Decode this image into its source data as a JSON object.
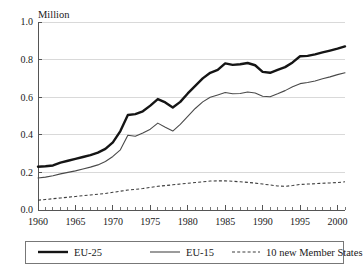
{
  "chart_data": {
    "type": "line",
    "title": "",
    "subtitle": "",
    "xlabel": "",
    "ylabel": "Million",
    "ylabel_position": "top-left",
    "xlim": [
      1960,
      2001
    ],
    "ylim": [
      0.0,
      1.0
    ],
    "grid": true,
    "grid_axis": "y",
    "legend_position": "bottom",
    "y_ticks": [
      "0.0",
      "0.2",
      "0.4",
      "0.6",
      "0.8",
      "1.0"
    ],
    "y_tick_values": [
      0.0,
      0.2,
      0.4,
      0.6,
      0.8,
      1.0
    ],
    "x_ticks": [
      "1960",
      "1965",
      "1970",
      "1975",
      "1980",
      "1985",
      "1990",
      "1995",
      "2000"
    ],
    "x_tick_values": [
      1960,
      1965,
      1970,
      1975,
      1980,
      1985,
      1990,
      1995,
      2000
    ],
    "x_minor_tick_step": 1,
    "x": [
      1960,
      1961,
      1962,
      1963,
      1964,
      1965,
      1966,
      1967,
      1968,
      1969,
      1970,
      1971,
      1972,
      1973,
      1974,
      1975,
      1976,
      1977,
      1978,
      1979,
      1980,
      1981,
      1982,
      1983,
      1984,
      1985,
      1986,
      1987,
      1988,
      1989,
      1990,
      1991,
      1992,
      1993,
      1994,
      1995,
      1996,
      1997,
      1998,
      1999,
      2000,
      2001
    ],
    "series": [
      {
        "name": "EU-25",
        "style": "solid-thick",
        "color": "#151515",
        "values": [
          0.23,
          0.233,
          0.237,
          0.252,
          0.262,
          0.272,
          0.282,
          0.292,
          0.305,
          0.325,
          0.36,
          0.42,
          0.505,
          0.51,
          0.525,
          0.555,
          0.59,
          0.572,
          0.545,
          0.575,
          0.62,
          0.66,
          0.7,
          0.73,
          0.745,
          0.78,
          0.772,
          0.775,
          0.782,
          0.77,
          0.735,
          0.73,
          0.745,
          0.76,
          0.785,
          0.818,
          0.82,
          0.828,
          0.838,
          0.848,
          0.858,
          0.87
        ]
      },
      {
        "name": "EU-15",
        "style": "solid-thin",
        "color": "#4a4a4a",
        "values": [
          0.17,
          0.175,
          0.182,
          0.192,
          0.2,
          0.208,
          0.218,
          0.228,
          0.24,
          0.258,
          0.285,
          0.32,
          0.398,
          0.392,
          0.41,
          0.43,
          0.462,
          0.44,
          0.42,
          0.455,
          0.498,
          0.54,
          0.575,
          0.6,
          0.612,
          0.625,
          0.618,
          0.62,
          0.628,
          0.622,
          0.605,
          0.602,
          0.618,
          0.635,
          0.655,
          0.672,
          0.678,
          0.686,
          0.698,
          0.708,
          0.72,
          0.73
        ]
      },
      {
        "name": "10 new Member States",
        "style": "dashed",
        "color": "#3d3d3d",
        "values": [
          0.052,
          0.056,
          0.06,
          0.064,
          0.068,
          0.072,
          0.076,
          0.08,
          0.084,
          0.088,
          0.094,
          0.1,
          0.106,
          0.11,
          0.114,
          0.12,
          0.126,
          0.13,
          0.134,
          0.138,
          0.142,
          0.146,
          0.15,
          0.154,
          0.155,
          0.155,
          0.153,
          0.15,
          0.147,
          0.143,
          0.138,
          0.133,
          0.128,
          0.126,
          0.13,
          0.136,
          0.138,
          0.14,
          0.142,
          0.144,
          0.146,
          0.15
        ]
      }
    ]
  },
  "legend": {
    "items": [
      {
        "label": "EU-25",
        "style": "solid-thick"
      },
      {
        "label": "EU-15",
        "style": "solid-thin"
      },
      {
        "label": "10 new Member States",
        "style": "dashed"
      }
    ]
  },
  "colors": {
    "eu25": "#151515",
    "eu15": "#4a4a4a",
    "new10": "#3d3d3d",
    "axis": "#555555",
    "grid": "#cfcfcf",
    "background": "#ffffff"
  }
}
